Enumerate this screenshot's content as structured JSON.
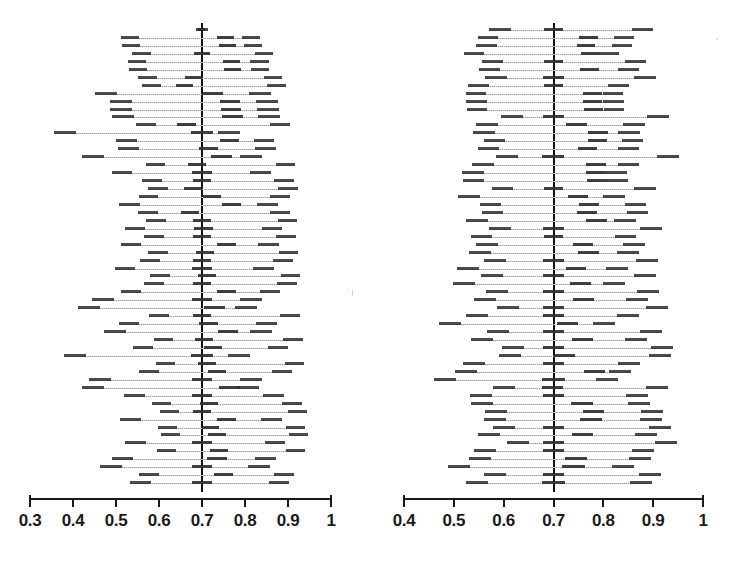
{
  "figure": {
    "title": "",
    "type": "paired-forest-plot",
    "background_color": "#ffffff",
    "reference_line_color": "#111111",
    "interval_line_color": "#b4b4b4",
    "marker_color": "#2b2b2b",
    "axis_color": "#1a1a1a"
  },
  "chart_data": [
    {
      "type": "forest",
      "panel": "left",
      "title": "",
      "xlabel": "",
      "ylabel": "",
      "xlim": [
        0.3,
        1.0
      ],
      "grid": false,
      "legend": null,
      "reference_line": 0.7,
      "tick_labels": [
        "0.3",
        "0.4",
        "0.5",
        "0.6",
        "0.7",
        "0.8",
        "0.9",
        "1"
      ],
      "tick_values": [
        0.3,
        0.4,
        0.5,
        0.6,
        0.7,
        0.8,
        0.9,
        1.0
      ],
      "n_intervals": 58,
      "intervals": [
        {
          "low": 0.685,
          "est": 0.7,
          "high": 0.715
        },
        {
          "low": 0.512,
          "est": 0.755,
          "high": 0.836
        },
        {
          "low": 0.514,
          "est": 0.76,
          "high": 0.84
        },
        {
          "low": 0.538,
          "est": 0.7,
          "high": 0.866
        },
        {
          "low": 0.528,
          "est": 0.769,
          "high": 0.855
        },
        {
          "low": 0.53,
          "est": 0.771,
          "high": 0.856
        },
        {
          "low": 0.552,
          "est": 0.68,
          "high": 0.887
        },
        {
          "low": 0.56,
          "est": 0.66,
          "high": 0.895
        },
        {
          "low": 0.452,
          "est": 0.724,
          "high": 0.861
        },
        {
          "low": 0.486,
          "est": 0.766,
          "high": 0.876
        },
        {
          "low": 0.487,
          "est": 0.768,
          "high": 0.878
        },
        {
          "low": 0.49,
          "est": 0.771,
          "high": 0.882
        },
        {
          "low": 0.547,
          "est": 0.664,
          "high": 0.905
        },
        {
          "low": 0.356,
          "est": 0.7,
          "high": 0.789
        },
        {
          "low": 0.501,
          "est": 0.764,
          "high": 0.868
        },
        {
          "low": 0.505,
          "est": 0.716,
          "high": 0.872
        },
        {
          "low": 0.42,
          "est": 0.745,
          "high": 0.839
        },
        {
          "low": 0.569,
          "est": 0.688,
          "high": 0.917
        },
        {
          "low": 0.49,
          "est": 0.7,
          "high": 0.861
        },
        {
          "low": 0.561,
          "est": 0.7,
          "high": 0.913
        },
        {
          "low": 0.575,
          "est": 0.678,
          "high": 0.923
        },
        {
          "low": 0.553,
          "est": 0.723,
          "high": 0.905
        },
        {
          "low": 0.507,
          "est": 0.768,
          "high": 0.876
        },
        {
          "low": 0.552,
          "est": 0.672,
          "high": 0.905
        },
        {
          "low": 0.57,
          "est": 0.7,
          "high": 0.922
        },
        {
          "low": 0.52,
          "est": 0.703,
          "high": 0.887
        },
        {
          "low": 0.565,
          "est": 0.7,
          "high": 0.919
        },
        {
          "low": 0.511,
          "est": 0.758,
          "high": 0.879
        },
        {
          "low": 0.575,
          "est": 0.706,
          "high": 0.924
        },
        {
          "low": 0.556,
          "est": 0.7,
          "high": 0.911
        },
        {
          "low": 0.497,
          "est": 0.7,
          "high": 0.868
        },
        {
          "low": 0.58,
          "est": 0.712,
          "high": 0.929
        },
        {
          "low": 0.566,
          "est": 0.7,
          "high": 0.92
        },
        {
          "low": 0.511,
          "est": 0.757,
          "high": 0.882
        },
        {
          "low": 0.444,
          "est": 0.7,
          "high": 0.84
        },
        {
          "low": 0.411,
          "est": 0.729,
          "high": 0.828
        },
        {
          "low": 0.577,
          "est": 0.7,
          "high": 0.927
        },
        {
          "low": 0.506,
          "est": 0.716,
          "high": 0.874
        },
        {
          "low": 0.473,
          "est": 0.76,
          "high": 0.862
        },
        {
          "low": 0.588,
          "est": 0.705,
          "high": 0.934
        },
        {
          "low": 0.54,
          "est": 0.726,
          "high": 0.9
        },
        {
          "low": 0.38,
          "est": 0.7,
          "high": 0.812
        },
        {
          "low": 0.592,
          "est": 0.712,
          "high": 0.937
        },
        {
          "low": 0.553,
          "est": 0.735,
          "high": 0.909
        },
        {
          "low": 0.437,
          "est": 0.7,
          "high": 0.839
        },
        {
          "low": 0.422,
          "est": 0.764,
          "high": 0.833
        },
        {
          "low": 0.519,
          "est": 0.7,
          "high": 0.89
        },
        {
          "low": 0.583,
          "est": 0.716,
          "high": 0.932
        },
        {
          "low": 0.602,
          "est": 0.7,
          "high": 0.944
        },
        {
          "low": 0.509,
          "est": 0.757,
          "high": 0.885
        },
        {
          "low": 0.598,
          "est": 0.72,
          "high": 0.94
        },
        {
          "low": 0.604,
          "est": 0.735,
          "high": 0.946
        },
        {
          "low": 0.522,
          "est": 0.7,
          "high": 0.894
        },
        {
          "low": 0.596,
          "est": 0.74,
          "high": 0.939
        },
        {
          "low": 0.49,
          "est": 0.735,
          "high": 0.872
        },
        {
          "low": 0.462,
          "est": 0.7,
          "high": 0.858
        },
        {
          "low": 0.554,
          "est": 0.75,
          "high": 0.915
        },
        {
          "low": 0.533,
          "est": 0.7,
          "high": 0.903
        }
      ]
    },
    {
      "type": "forest",
      "panel": "right",
      "title": "",
      "xlabel": "",
      "ylabel": "",
      "xlim": [
        0.4,
        1.0
      ],
      "grid": false,
      "legend": null,
      "reference_line": 0.7,
      "tick_labels": [
        "0.4",
        "0.5",
        "0.6",
        "0.7",
        "0.8",
        "0.9",
        "1"
      ],
      "tick_values": [
        0.4,
        0.5,
        0.6,
        0.7,
        0.8,
        0.9,
        1.0
      ],
      "n_intervals": 58,
      "intervals": [
        {
          "low": 0.571,
          "est": 0.7,
          "high": 0.9
        },
        {
          "low": 0.548,
          "est": 0.77,
          "high": 0.862
        },
        {
          "low": 0.545,
          "est": 0.765,
          "high": 0.858
        },
        {
          "low": 0.52,
          "est": 0.773,
          "high": 0.831
        },
        {
          "low": 0.556,
          "est": 0.7,
          "high": 0.886
        },
        {
          "low": 0.551,
          "est": 0.772,
          "high": 0.872
        },
        {
          "low": 0.562,
          "est": 0.7,
          "high": 0.906
        },
        {
          "low": 0.529,
          "est": 0.7,
          "high": 0.852
        },
        {
          "low": 0.524,
          "est": 0.778,
          "high": 0.84
        },
        {
          "low": 0.525,
          "est": 0.779,
          "high": 0.841
        },
        {
          "low": 0.526,
          "est": 0.78,
          "high": 0.842
        },
        {
          "low": 0.594,
          "est": 0.7,
          "high": 0.932
        },
        {
          "low": 0.545,
          "est": 0.746,
          "high": 0.884
        },
        {
          "low": 0.538,
          "est": 0.79,
          "high": 0.874
        },
        {
          "low": 0.561,
          "est": 0.788,
          "high": 0.879
        },
        {
          "low": 0.549,
          "est": 0.768,
          "high": 0.872
        },
        {
          "low": 0.584,
          "est": 0.7,
          "high": 0.952
        },
        {
          "low": 0.537,
          "est": 0.785,
          "high": 0.872
        },
        {
          "low": 0.517,
          "est": 0.786,
          "high": 0.848
        },
        {
          "low": 0.518,
          "est": 0.787,
          "high": 0.85
        },
        {
          "low": 0.577,
          "est": 0.7,
          "high": 0.905
        },
        {
          "low": 0.508,
          "est": 0.75,
          "high": 0.843
        },
        {
          "low": 0.552,
          "est": 0.772,
          "high": 0.886
        },
        {
          "low": 0.556,
          "est": 0.768,
          "high": 0.89
        },
        {
          "low": 0.524,
          "est": 0.786,
          "high": 0.865
        },
        {
          "low": 0.57,
          "est": 0.7,
          "high": 0.917
        },
        {
          "low": 0.534,
          "est": 0.7,
          "high": 0.866
        },
        {
          "low": 0.545,
          "est": 0.76,
          "high": 0.883
        },
        {
          "low": 0.531,
          "est": 0.77,
          "high": 0.872
        },
        {
          "low": 0.561,
          "est": 0.7,
          "high": 0.909
        },
        {
          "low": 0.506,
          "est": 0.745,
          "high": 0.849
        },
        {
          "low": 0.554,
          "est": 0.7,
          "high": 0.905
        },
        {
          "low": 0.498,
          "est": 0.754,
          "high": 0.843
        },
        {
          "low": 0.564,
          "est": 0.7,
          "high": 0.912
        },
        {
          "low": 0.54,
          "est": 0.761,
          "high": 0.889
        },
        {
          "low": 0.586,
          "est": 0.7,
          "high": 0.929
        },
        {
          "low": 0.524,
          "est": 0.7,
          "high": 0.871
        },
        {
          "low": 0.47,
          "est": 0.728,
          "high": 0.824
        },
        {
          "low": 0.567,
          "est": 0.7,
          "high": 0.918
        },
        {
          "low": 0.535,
          "est": 0.759,
          "high": 0.888
        },
        {
          "low": 0.597,
          "est": 0.7,
          "high": 0.94
        },
        {
          "low": 0.591,
          "est": 0.722,
          "high": 0.935
        },
        {
          "low": 0.519,
          "est": 0.7,
          "high": 0.873
        },
        {
          "low": 0.502,
          "est": 0.782,
          "high": 0.855
        },
        {
          "low": 0.46,
          "est": 0.7,
          "high": 0.83
        },
        {
          "low": 0.578,
          "est": 0.698,
          "high": 0.929
        },
        {
          "low": 0.533,
          "est": 0.7,
          "high": 0.89
        },
        {
          "low": 0.535,
          "est": 0.757,
          "high": 0.893
        },
        {
          "low": 0.563,
          "est": 0.78,
          "high": 0.92
        },
        {
          "low": 0.56,
          "est": 0.775,
          "high": 0.918
        },
        {
          "low": 0.579,
          "est": 0.7,
          "high": 0.935
        },
        {
          "low": 0.548,
          "est": 0.758,
          "high": 0.907
        },
        {
          "low": 0.606,
          "est": 0.7,
          "high": 0.947
        },
        {
          "low": 0.54,
          "est": 0.7,
          "high": 0.902
        },
        {
          "low": 0.53,
          "est": 0.745,
          "high": 0.895
        },
        {
          "low": 0.489,
          "est": 0.74,
          "high": 0.861
        },
        {
          "low": 0.561,
          "est": 0.7,
          "high": 0.915
        },
        {
          "low": 0.525,
          "est": 0.7,
          "high": 0.897
        }
      ]
    }
  ]
}
